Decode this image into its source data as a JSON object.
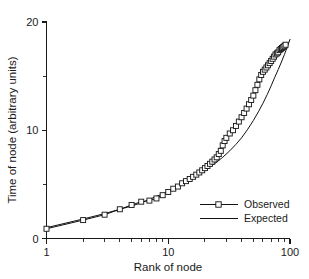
{
  "chart_data": {
    "type": "line",
    "title": "",
    "xlabel": "Rank of node",
    "ylabel": "Time of node (arbitrary units)",
    "xscale": "log",
    "yscale": "linear",
    "xlim": [
      1,
      100
    ],
    "ylim": [
      0,
      20
    ],
    "grid": false,
    "legend_position": "lower right",
    "x_tick_labels": [
      "1",
      "10",
      "100"
    ],
    "x_tick_values": [
      1,
      10,
      100
    ],
    "x_minor_ticks": [
      2,
      3,
      4,
      5,
      6,
      7,
      8,
      9,
      20,
      30,
      40,
      50,
      60,
      70,
      80,
      90
    ],
    "y_tick_labels": [
      "0",
      "10",
      "20"
    ],
    "y_tick_values": [
      0,
      10,
      20
    ],
    "y_minor_ticks": [
      5,
      15
    ],
    "series": [
      {
        "name": "Observed",
        "marker": "open-square",
        "x": [
          1,
          2,
          3,
          4,
          5,
          6,
          7,
          8,
          9,
          10,
          11,
          12,
          13,
          14,
          15,
          16,
          17,
          18,
          19,
          20,
          21,
          22,
          23,
          24,
          25,
          26,
          27,
          28,
          29,
          30,
          32,
          34,
          36,
          38,
          40,
          42,
          44,
          46,
          48,
          50,
          52,
          54,
          56,
          58,
          60,
          62,
          64,
          66,
          68,
          70,
          72,
          74,
          76,
          78,
          80,
          82,
          84,
          86,
          88,
          90,
          92
        ],
        "values": [
          0.9,
          1.7,
          2.2,
          2.7,
          3.1,
          3.4,
          3.5,
          3.7,
          4.0,
          4.3,
          4.6,
          4.8,
          5.1,
          5.3,
          5.5,
          5.7,
          5.9,
          6.1,
          6.3,
          6.5,
          6.7,
          6.9,
          7.1,
          7.3,
          7.5,
          7.8,
          8.1,
          8.6,
          9.0,
          9.3,
          9.7,
          10.0,
          10.4,
          10.8,
          11.2,
          11.6,
          12.0,
          12.4,
          12.8,
          13.2,
          13.7,
          14.2,
          14.7,
          15.1,
          15.4,
          15.6,
          15.8,
          16.0,
          16.2,
          16.4,
          16.6,
          16.8,
          17.0,
          17.1,
          17.2,
          17.4,
          17.5,
          17.6,
          17.7,
          17.8,
          17.9
        ]
      },
      {
        "name": "Expected",
        "marker": "none",
        "x": [
          1,
          2,
          3,
          4,
          5,
          6,
          7,
          8,
          9,
          10,
          12,
          14,
          16,
          18,
          20,
          24,
          28,
          32,
          36,
          40,
          45,
          50,
          55,
          60,
          65,
          70,
          75,
          80,
          85,
          90,
          95,
          100
        ],
        "values": [
          1.0,
          1.8,
          2.3,
          2.7,
          3.0,
          3.3,
          3.6,
          3.9,
          4.1,
          4.4,
          4.8,
          5.2,
          5.6,
          6.0,
          6.3,
          6.9,
          7.5,
          8.1,
          8.7,
          9.3,
          10.1,
          10.9,
          11.7,
          12.5,
          13.3,
          14.1,
          14.9,
          15.6,
          16.3,
          17.0,
          17.7,
          18.4
        ]
      }
    ]
  },
  "legend": {
    "items": [
      {
        "label": "Observed"
      },
      {
        "label": "Expected"
      }
    ]
  }
}
